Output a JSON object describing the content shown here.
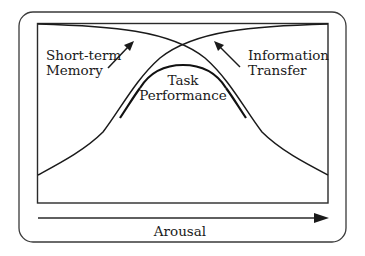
{
  "diagram": {
    "labels": {
      "short_term_line1": "Short-term",
      "short_term_line2": "Memory",
      "info_line1": "Information",
      "info_line2": "Transfer",
      "task_line1": "Task",
      "task_line2": "Performance",
      "x_axis": "Arousal"
    },
    "curves": [
      {
        "name": "Short-term Memory",
        "trend": "decreasing with arousal"
      },
      {
        "name": "Information Transfer",
        "trend": "increasing with arousal"
      },
      {
        "name": "Task Performance",
        "trend": "inverted U, peaks at mid arousal"
      }
    ],
    "colors": {
      "stroke": "#1a1a1a",
      "background": "#ffffff"
    }
  }
}
